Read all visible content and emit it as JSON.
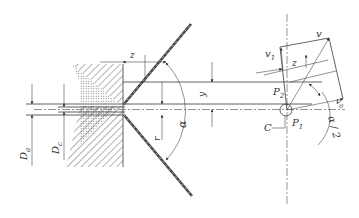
{
  "diagram": {
    "labels": {
      "D_a": "D",
      "D_a_sub": "a",
      "D_c": "D",
      "D_c_sub": "c",
      "z_top": "z",
      "y": "y",
      "r": "r",
      "alpha": "α",
      "v": "v",
      "v1": "v",
      "v1_sub": "1",
      "z_right": "z",
      "P2": "P",
      "P2_sub": "2",
      "P1": "P",
      "P1_sub": "1",
      "C": "C",
      "v0": "v",
      "v0_sub": "0",
      "alpha_half": "α / 2"
    },
    "colors": {
      "line": "#3a3a3a",
      "hatch": "#555555",
      "background": "#ffffff"
    }
  }
}
